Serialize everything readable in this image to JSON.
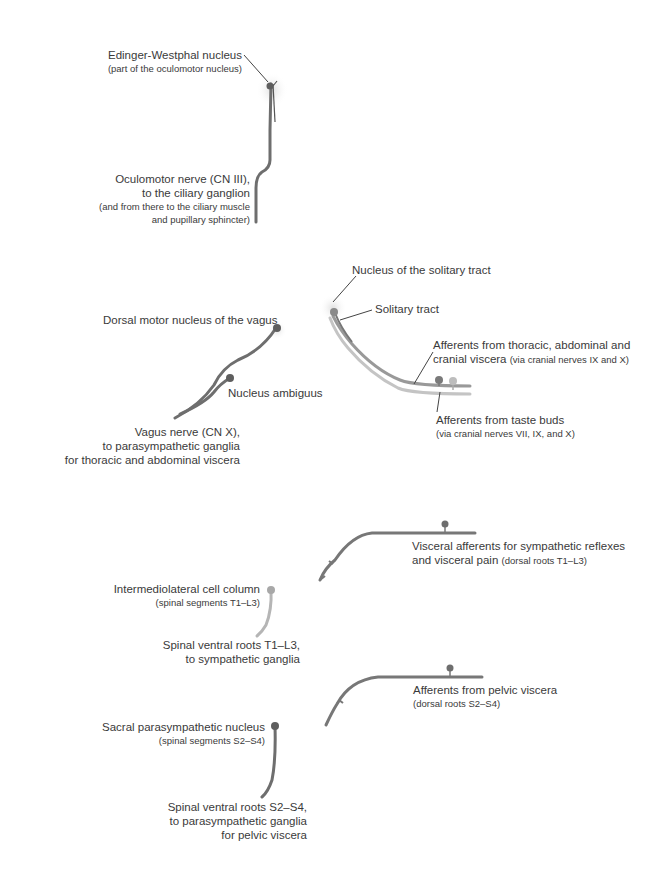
{
  "diagram": {
    "colors": {
      "parasympathetic_efferent": "#6e6e6e",
      "sympathetic_efferent": "#b5b5b5",
      "afferent": "#7a7a7a",
      "afferent_light": "#c4c4c4",
      "nucleus_glow": "#e8e8e8",
      "text": "#3a3a3a"
    },
    "cranial_oculomotor": {
      "nucleus_label": "Edinger-Westphal nucleus",
      "nucleus_sub": "(part of the oculomotor nucleus)",
      "nerve_lines": [
        "Oculomotor nerve (CN III),",
        "to the ciliary ganglion"
      ],
      "nerve_sub_lines": [
        "(and from there to the ciliary muscle",
        "and pupillary sphincter)"
      ]
    },
    "cranial_vagus": {
      "dorsal_label": "Dorsal motor nucleus of the vagus",
      "ambiguus_label": "Nucleus ambiguus",
      "nerve_lines": [
        "Vagus nerve (CN X),",
        "to parasympathetic ganglia",
        "for thoracic and abdominal viscera"
      ]
    },
    "solitary": {
      "nucleus_label": "Nucleus of the solitary tract",
      "tract_label": "Solitary tract",
      "visceral_afferent_line1": "Afferents from thoracic, abdominal and",
      "visceral_afferent_line2": "cranial viscera",
      "visceral_afferent_sub": "(via cranial nerves IX and X)",
      "taste_label": "Afferents from taste buds",
      "taste_sub": "(via cranial nerves VII, IX, and X)"
    },
    "thoracolumbar": {
      "afferent_line1": "Visceral afferents for sympathetic reflexes",
      "afferent_line2": "and visceral pain",
      "afferent_sub": "(dorsal roots T1–L3)",
      "column_label": "Intermediolateral cell column",
      "column_sub": "(spinal segments T1–L3)",
      "roots_lines": [
        "Spinal ventral roots T1–L3,",
        "to sympathetic ganglia"
      ]
    },
    "sacral": {
      "afferent_label": "Afferents from pelvic viscera",
      "afferent_sub": "(dorsal roots S2–S4)",
      "nucleus_label": "Sacral parasympathetic nucleus",
      "nucleus_sub": "(spinal segments S2–S4)",
      "roots_lines": [
        "Spinal ventral roots S2–S4,",
        "to parasympathetic ganglia",
        "for pelvic viscera"
      ]
    }
  }
}
